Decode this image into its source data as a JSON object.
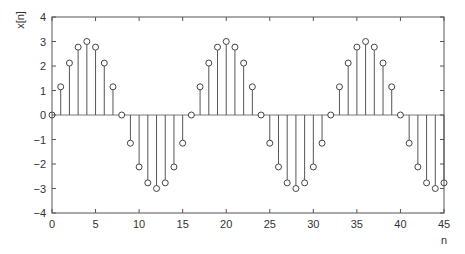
{
  "chart_data": {
    "type": "stem",
    "title": "",
    "xlabel": "n",
    "ylabel": "x[n]",
    "xlim": [
      0,
      45
    ],
    "ylim": [
      -4,
      4
    ],
    "grid": false,
    "legend": null,
    "xticks": [
      0,
      5,
      10,
      15,
      20,
      25,
      30,
      35,
      40,
      45
    ],
    "yticks": [
      -4,
      -3,
      -2,
      -1,
      0,
      1,
      2,
      3,
      4
    ],
    "xtick_labels": [
      "0",
      "5",
      "10",
      "15",
      "20",
      "25",
      "30",
      "35",
      "40",
      "45"
    ],
    "ytick_labels": [
      "−4",
      "−3",
      "−2",
      "−1",
      "0",
      "1",
      "2",
      "3",
      "4"
    ],
    "x": [
      0,
      1,
      2,
      3,
      4,
      5,
      6,
      7,
      8,
      9,
      10,
      11,
      12,
      13,
      14,
      15,
      16,
      17,
      18,
      19,
      20,
      21,
      22,
      23,
      24,
      25,
      26,
      27,
      28,
      29,
      30,
      31,
      32,
      33,
      34,
      35,
      36,
      37,
      38,
      39,
      40,
      41,
      42,
      43,
      44,
      45
    ],
    "values": [
      0,
      1.15,
      2.12,
      2.77,
      3,
      2.77,
      2.12,
      1.15,
      0,
      -1.15,
      -2.12,
      -2.77,
      -3,
      -2.77,
      -2.12,
      -1.15,
      0,
      1.15,
      2.12,
      2.77,
      3,
      2.77,
      2.12,
      1.15,
      0,
      -1.15,
      -2.12,
      -2.77,
      -3,
      -2.77,
      -2.12,
      -1.15,
      0,
      1.15,
      2.12,
      2.77,
      3,
      2.77,
      2.12,
      1.15,
      0,
      -1.15,
      -2.12,
      -2.77,
      -3,
      -2.77
    ],
    "colors": {
      "stem": "#555555",
      "marker_edge": "#444444",
      "axes": "#555555",
      "text": "#333333"
    }
  }
}
